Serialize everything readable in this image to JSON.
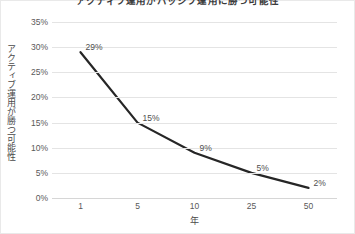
{
  "chart_data": {
    "type": "line",
    "title": "アクティブ運用がパッシブ運用に勝つ可能性",
    "xlabel": "年",
    "ylabel": "アクティブ運用が勝つ可能性",
    "categories": [
      "1",
      "5",
      "10",
      "25",
      "50"
    ],
    "values": [
      29,
      15,
      9,
      5,
      2
    ],
    "point_labels": [
      "29%",
      "15%",
      "9%",
      "5%",
      "2%"
    ],
    "ytick_labels": [
      "35%",
      "30%",
      "25%",
      "20%",
      "15%",
      "10%",
      "5%",
      "0%"
    ],
    "ytick_values": [
      35,
      30,
      25,
      20,
      15,
      10,
      5,
      0
    ],
    "ylim": [
      0,
      35
    ],
    "grid": true,
    "legend": "none",
    "series_color": "#262626",
    "grid_color": "#e4e4e4",
    "text_color": "#595959",
    "background": "#ffffff"
  }
}
